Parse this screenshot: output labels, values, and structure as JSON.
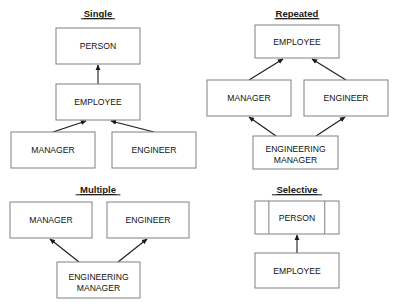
{
  "figure": {
    "kind": "uml-inheritance-diagram",
    "background_color": "#ffffff",
    "box_fill_color": "#ffffff",
    "box_border_color": "#808080",
    "connector_color": "#1a1a1a",
    "text_color": "#111111"
  },
  "panels": [
    {
      "id": "single",
      "title": "Single",
      "title_x": 98,
      "title_y": 17,
      "nodes": [
        {
          "id": "single-person",
          "label": "PERSON",
          "label2": "",
          "x": 56,
          "y": 28,
          "w": 84,
          "h": 36,
          "compartments": []
        },
        {
          "id": "single-employee",
          "label": "EMPLOYEE",
          "label2": "",
          "x": 56,
          "y": 84,
          "w": 84,
          "h": 36,
          "compartments": []
        },
        {
          "id": "single-manager",
          "label": "MANAGER",
          "label2": "",
          "x": 11,
          "y": 132,
          "w": 84,
          "h": 36,
          "compartments": []
        },
        {
          "id": "single-engineer",
          "label": "ENGINEER",
          "label2": "",
          "x": 112,
          "y": 132,
          "w": 84,
          "h": 36,
          "compartments": []
        }
      ],
      "links": [
        {
          "id": "single-employee-to-person",
          "from": "single-employee",
          "to": "single-person",
          "x1": 98,
          "y1": 84,
          "x2": 98,
          "y2": 65
        },
        {
          "id": "single-manager-to-employee",
          "from": "single-manager",
          "to": "single-employee",
          "x1": 53,
          "y1": 132,
          "x2": 86,
          "y2": 121
        },
        {
          "id": "single-engineer-to-employee",
          "from": "single-engineer",
          "to": "single-employee",
          "x1": 154,
          "y1": 132,
          "x2": 111,
          "y2": 121
        }
      ]
    },
    {
      "id": "repeated",
      "title": "Repeated",
      "title_x": 297,
      "title_y": 17,
      "nodes": [
        {
          "id": "repeated-employee",
          "label": "EMPLOYEE",
          "label2": "",
          "x": 255,
          "y": 25,
          "w": 84,
          "h": 33,
          "compartments": []
        },
        {
          "id": "repeated-manager",
          "label": "MANAGER",
          "label2": "",
          "x": 207,
          "y": 80,
          "w": 84,
          "h": 36,
          "compartments": []
        },
        {
          "id": "repeated-engineer",
          "label": "ENGINEER",
          "label2": "",
          "x": 304,
          "y": 80,
          "w": 84,
          "h": 36,
          "compartments": []
        },
        {
          "id": "repeated-engmanager",
          "label": "ENGINEERING",
          "label2": "MANAGER",
          "x": 253,
          "y": 136,
          "w": 85,
          "h": 33,
          "compartments": []
        }
      ],
      "links": [
        {
          "id": "repeated-manager-to-employee",
          "from": "repeated-manager",
          "to": "repeated-employee",
          "x1": 249,
          "y1": 80,
          "x2": 283,
          "y2": 59
        },
        {
          "id": "repeated-engineer-to-employee",
          "from": "repeated-engineer",
          "to": "repeated-employee",
          "x1": 346,
          "y1": 80,
          "x2": 312,
          "y2": 59
        },
        {
          "id": "repeated-engmanager-to-manager",
          "from": "repeated-engmanager",
          "to": "repeated-manager",
          "x1": 276,
          "y1": 136,
          "x2": 249,
          "y2": 117
        },
        {
          "id": "repeated-engmanager-to-engineer",
          "from": "repeated-engmanager",
          "to": "repeated-engineer",
          "x1": 316,
          "y1": 136,
          "x2": 345,
          "y2": 117
        }
      ]
    },
    {
      "id": "multiple",
      "title": "Multiple",
      "title_x": 98,
      "title_y": 193,
      "nodes": [
        {
          "id": "multiple-manager",
          "label": "MANAGER",
          "label2": "",
          "x": 10,
          "y": 202,
          "w": 82,
          "h": 36,
          "compartments": []
        },
        {
          "id": "multiple-engineer",
          "label": "ENGINEER",
          "label2": "",
          "x": 107,
          "y": 202,
          "w": 82,
          "h": 36,
          "compartments": []
        },
        {
          "id": "multiple-engmanager",
          "label": "ENGINEERING",
          "label2": "MANAGER",
          "x": 57,
          "y": 262,
          "w": 83,
          "h": 36,
          "compartments": []
        }
      ],
      "links": [
        {
          "id": "multiple-engmanager-to-manager",
          "from": "multiple-engmanager",
          "to": "multiple-manager",
          "x1": 79,
          "y1": 262,
          "x2": 50,
          "y2": 239
        },
        {
          "id": "multiple-engmanager-to-engineer",
          "from": "multiple-engmanager",
          "to": "multiple-engineer",
          "x1": 118,
          "y1": 262,
          "x2": 147,
          "y2": 239
        }
      ]
    },
    {
      "id": "selective",
      "title": "Selective",
      "title_x": 297,
      "title_y": 193,
      "nodes": [
        {
          "id": "selective-person",
          "label": "PERSON",
          "label2": "",
          "x": 255,
          "y": 201,
          "w": 84,
          "h": 33,
          "compartments": [
            0.165,
            0.83
          ]
        },
        {
          "id": "selective-employee",
          "label": "EMPLOYEE",
          "label2": "",
          "x": 255,
          "y": 253,
          "w": 84,
          "h": 35,
          "compartments": []
        }
      ],
      "links": [
        {
          "id": "selective-employee-to-person",
          "from": "selective-employee",
          "to": "selective-person",
          "x1": 297,
          "y1": 253,
          "x2": 297,
          "y2": 235
        }
      ]
    }
  ]
}
